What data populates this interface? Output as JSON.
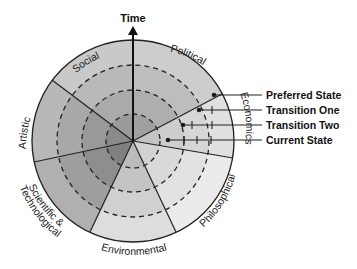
{
  "diagram": {
    "axis_label": "Time",
    "sectors": [
      {
        "label": "Political",
        "color": "#cfcfcf"
      },
      {
        "label": "Economics",
        "color": "#e4e4e4"
      },
      {
        "label": "Philosophical",
        "color": "#ececec"
      },
      {
        "label": "Environmental",
        "color": "#d9d9d9"
      },
      {
        "label": "Scientific & Technological",
        "color": "#a9a9a9"
      },
      {
        "label": "Artistic",
        "color": "#b4b4b4"
      },
      {
        "label": "Social",
        "color": "#c6c6c6"
      }
    ],
    "sector_label_lines": {
      "scientific_line1": "Scientific &",
      "scientific_line2": "Technological"
    },
    "legend": [
      {
        "label": "Preferred State"
      },
      {
        "label": "Transition One"
      },
      {
        "label": "Transition Two"
      },
      {
        "label": "Current State"
      }
    ]
  }
}
